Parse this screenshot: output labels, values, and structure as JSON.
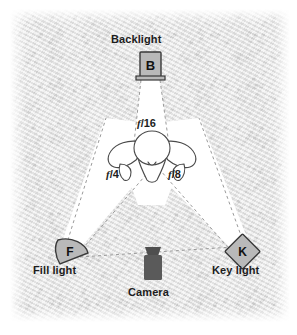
{
  "diagram": {
    "background_color": "#e9e9e9",
    "beam_color": "#ffffff",
    "line_color": "#8a8a8a",
    "fixture_fill": "#b9b9b9",
    "fixture_stroke": "#3a3a3a",
    "camera_color": "#5a5a5a",
    "subject_stroke": "#4a4a4a",
    "nodes": [
      {
        "id": "backlight",
        "label": "Backlight",
        "badge": "B",
        "shape": "rectangle",
        "x": 150,
        "y": 65,
        "aperture": "f/16"
      },
      {
        "id": "fill-light",
        "label": "Fill light",
        "badge": "F",
        "shape": "dome",
        "x": 70,
        "y": 251,
        "aperture": "f/4"
      },
      {
        "id": "key-light",
        "label": "Key light",
        "badge": "K",
        "shape": "diamond",
        "x": 242,
        "y": 251,
        "aperture": "f/8"
      },
      {
        "id": "camera",
        "label": "Camera",
        "badge": "",
        "shape": "camera-body",
        "x": 153,
        "y": 265,
        "aperture": ""
      },
      {
        "id": "subject",
        "label": "",
        "badge": "",
        "shape": "head-overhead",
        "x": 152,
        "y": 153,
        "aperture": ""
      }
    ],
    "apertures": {
      "backlight": "f/16",
      "fill": "f/4",
      "key": "f/8"
    },
    "labels": {
      "backlight": "Backlight",
      "fill_light": "Fill light",
      "key_light": "Key light",
      "camera": "Camera"
    },
    "badges": {
      "backlight": "B",
      "fill_light": "F",
      "key_light": "K"
    },
    "fstop_parts": {
      "f16": {
        "f": "f",
        "rest": "/16"
      },
      "f4": {
        "f": "f",
        "rest": "/4"
      },
      "f8": {
        "f": "f",
        "rest": "/8"
      }
    }
  }
}
